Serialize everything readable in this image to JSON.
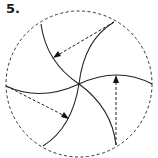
{
  "figure": {
    "label": "5.",
    "stroke_color": "#222222",
    "background": "#ffffff"
  },
  "diagram": {
    "type": "rotational-symmetry-spiral",
    "outer_circle": {
      "style": "dashed",
      "cx": 79,
      "cy": 84,
      "r": 73
    },
    "center": [
      79,
      84
    ],
    "curved_spokes": 6,
    "dashed_arrows": 3
  }
}
